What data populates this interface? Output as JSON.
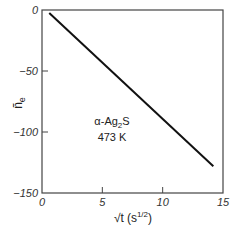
{
  "chart_data": {
    "type": "line",
    "title": "",
    "xlabel": "√t (s^1/2)",
    "ylabel": "ñe",
    "xlim": [
      0,
      15
    ],
    "ylim": [
      -150,
      0
    ],
    "x_ticks": [
      0,
      5,
      10,
      15
    ],
    "y_ticks": [
      0,
      -50,
      -100,
      -150
    ],
    "x_tick_labels": [
      "0",
      "5",
      "10",
      "15"
    ],
    "y_tick_labels": [
      "0",
      "-50",
      "-100",
      "-150"
    ],
    "grid": false,
    "legend": null,
    "series": [
      {
        "name": "α-Ag2S 473 K",
        "x": [
          0.6,
          14.2
        ],
        "y": [
          -2.5,
          -128
        ]
      }
    ],
    "annotations": [
      {
        "text": "α-Ag2S",
        "x": 9.0,
        "y": -100
      },
      {
        "text": "473 K",
        "x": 9.0,
        "y": -112
      }
    ]
  },
  "labels": {
    "xlabel_main": "√t",
    "xlabel_unit": "(s",
    "xlabel_exp": "1/2",
    "xlabel_close": ")",
    "ylabel_main": "ñ",
    "ylabel_sub": "e",
    "annot_line1_a": "α-Ag",
    "annot_line1_sub": "2",
    "annot_line1_b": "S",
    "annot_line2": "473 K"
  }
}
